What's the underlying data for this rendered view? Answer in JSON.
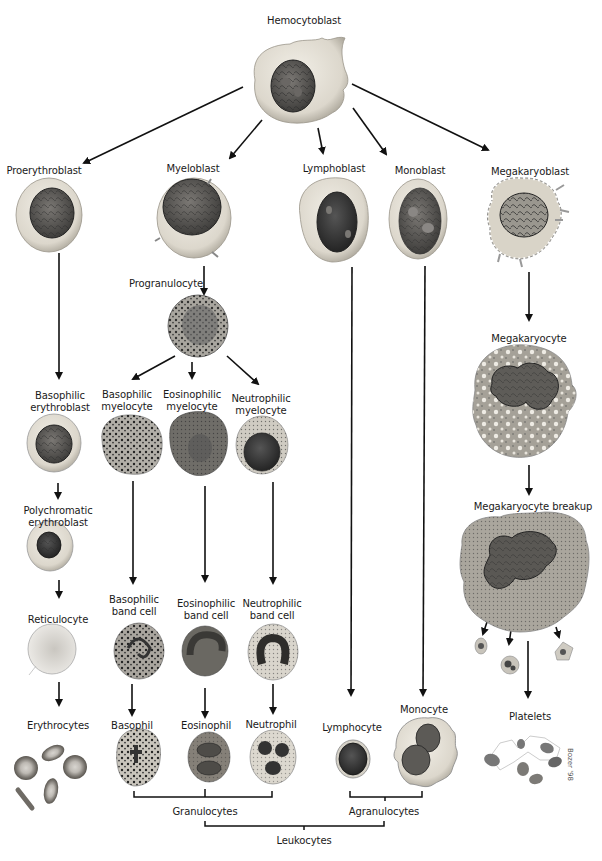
{
  "title": "Hemocytoblast",
  "stem_cell": {
    "label": "Hemocytoblast"
  },
  "blasts": [
    {
      "id": "proerythroblast",
      "label": "Proerythroblast"
    },
    {
      "id": "myeloblast",
      "label": "Myeloblast"
    },
    {
      "id": "lymphoblast",
      "label": "Lymphoblast"
    },
    {
      "id": "monoblast",
      "label": "Monoblast"
    },
    {
      "id": "megakaryoblast",
      "label": "Megakaryoblast"
    }
  ],
  "erythroid_line": {
    "basophilic_erythroblast": [
      "Basophilic",
      "erythroblast"
    ],
    "polychromatic_erythroblast": [
      "Polychromatic",
      "erythroblast"
    ],
    "reticulocyte": "Reticulocyte",
    "erythrocytes": "Erythrocytes"
  },
  "myeloid_line": {
    "progranulocyte": "Progranulocyte",
    "myelocytes": [
      [
        "Basophilic",
        "myelocyte"
      ],
      [
        "Eosinophilic",
        "myelocyte"
      ],
      [
        "Neutrophilic",
        "myelocyte"
      ]
    ],
    "band_cells": [
      [
        "Basophilic",
        "band cell"
      ],
      [
        "Eosinophilic",
        "band cell"
      ],
      [
        "Neutrophilic",
        "band cell"
      ]
    ],
    "mature": [
      "Basophil",
      "Eosinophil",
      "Neutrophil"
    ]
  },
  "lymphoid_line": {
    "mature": "Lymphocyte"
  },
  "monocytic_line": {
    "mature": "Monocyte"
  },
  "megakaryocytic_line": {
    "megakaryocyte": "Megakaryocyte",
    "breakup": "Megakaryocyte breakup",
    "platelets": "Platelets"
  },
  "groupings": {
    "granulocytes": "Granulocytes",
    "agranulocytes": "Agranulocytes",
    "leukocytes": "Leukocytes"
  },
  "signature": "Bozer '98",
  "colors": {
    "line": "#111111",
    "cytoplasm": "#e4e0d6",
    "cytoplasm_edge": "#8e8a80",
    "nucleus": "#4a4a48",
    "nucleus_light": "#7a7874",
    "granule": "#222222"
  }
}
